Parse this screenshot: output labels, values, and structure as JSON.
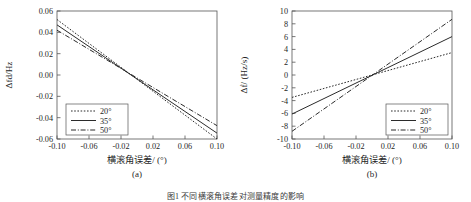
{
  "figure": {
    "caption": "图1  不同横滚角误差对测量精度的影响",
    "panels": [
      "(a)",
      "(b)"
    ]
  },
  "chart_data": [
    {
      "type": "line",
      "panel": "(a)",
      "title": "",
      "xlabel": "横滚角误差/ (°)",
      "ylabel": "Δfd/Hz",
      "xlim": [
        -0.1,
        0.1
      ],
      "ylim": [
        -0.06,
        0.06
      ],
      "xticks": [
        -0.1,
        -0.06,
        -0.02,
        0.02,
        0.06,
        0.1
      ],
      "xticklabels": [
        "-0.10",
        "-0.06",
        "-0.02",
        "0.02",
        "0.06",
        "0.10"
      ],
      "yticks": [
        -0.06,
        -0.04,
        -0.02,
        0.0,
        0.02,
        0.04,
        0.06
      ],
      "yticklabels": [
        "-0.06",
        "-0.04",
        "-0.02",
        "0.00",
        "0.02",
        "0.04",
        "0.06"
      ],
      "grid": false,
      "legend_position": "lower-left",
      "x": [
        -0.1,
        0.1
      ],
      "series": [
        {
          "name": "20°",
          "style": "dotted",
          "values": [
            0.052,
            -0.06
          ]
        },
        {
          "name": "35°",
          "style": "solid",
          "values": [
            0.047,
            -0.0545
          ]
        },
        {
          "name": "50°",
          "style": "dashdot",
          "values": [
            0.042,
            -0.0475
          ]
        }
      ]
    },
    {
      "type": "line",
      "panel": "(b)",
      "title": "",
      "xlabel": "横滚角误差/ (°)",
      "ylabel": "Δḟ/ (Hz/s)",
      "xlim": [
        -0.1,
        0.1
      ],
      "ylim": [
        -10,
        10
      ],
      "xticks": [
        -0.1,
        -0.06,
        -0.02,
        0.02,
        0.06,
        0.1
      ],
      "xticklabels": [
        "-0.10",
        "-0.06",
        "-0.02",
        "0.02",
        "0.06",
        "0.10"
      ],
      "yticks": [
        -10,
        -8,
        -6,
        -4,
        -2,
        0,
        2,
        4,
        6,
        8,
        10
      ],
      "yticklabels": [
        "-10",
        "-8",
        "-6",
        "-4",
        "-2",
        "0",
        "2",
        "4",
        "6",
        "8",
        "10"
      ],
      "grid": false,
      "legend_position": "lower-right",
      "x": [
        -0.1,
        0.1
      ],
      "series": [
        {
          "name": "20°",
          "style": "dotted",
          "values": [
            -3.5,
            3.5
          ]
        },
        {
          "name": "35°",
          "style": "solid",
          "values": [
            -6.1,
            6.0
          ]
        },
        {
          "name": "50°",
          "style": "dashdot",
          "values": [
            -8.8,
            8.7
          ]
        }
      ]
    }
  ]
}
